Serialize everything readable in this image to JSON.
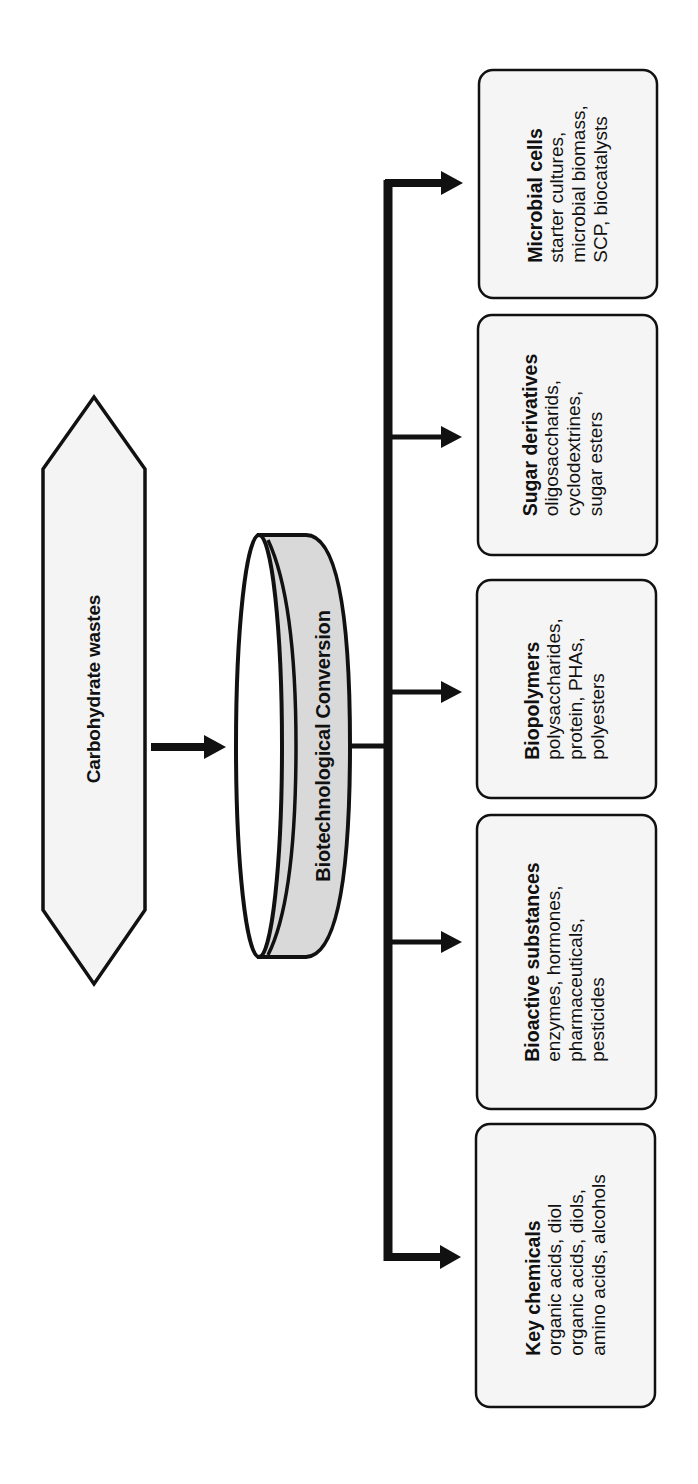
{
  "diagram": {
    "source_node": {
      "label": "Carbohydrate wastes",
      "shape": "hexagon",
      "fill": "#f4f4f4"
    },
    "process_node": {
      "label": "Biotechnological Conversion",
      "shape": "cylinder",
      "fill": "#d9d9d9"
    },
    "edges": [
      {
        "from": "Carbohydrate wastes",
        "to": "Biotechnological Conversion"
      },
      {
        "from": "Biotechnological Conversion",
        "to": "Microbial cells"
      },
      {
        "from": "Biotechnological Conversion",
        "to": "Sugar derivatives"
      },
      {
        "from": "Biotechnological Conversion",
        "to": "Biopolymers"
      },
      {
        "from": "Biotechnological Conversion",
        "to": "Bioactive substances"
      },
      {
        "from": "Biotechnological Conversion",
        "to": "Key chemicals"
      }
    ],
    "products": [
      {
        "title": "Microbial cells",
        "lines": [
          "starter cultures,",
          "microbial biomass,",
          "SCP, biocatalysts"
        ]
      },
      {
        "title": "Sugar derivatives",
        "lines": [
          "oligosaccharids,",
          "cyclodextrines,",
          "sugar esters"
        ]
      },
      {
        "title": "Biopolymers",
        "lines": [
          "polysaccharides,",
          "protein, PHAs,",
          "polyesters"
        ]
      },
      {
        "title": "Bioactive substances",
        "lines": [
          "enzymes, hormones,",
          "pharmaceuticals,",
          "pesticides"
        ]
      },
      {
        "title": "Key chemicals",
        "lines": [
          "organic acids, diol",
          "organic acids, diols,",
          "amino acids, alcohols"
        ]
      }
    ],
    "colors": {
      "stroke": "#111111",
      "box_fill": "#f5f5f5",
      "background": "#ffffff"
    }
  }
}
